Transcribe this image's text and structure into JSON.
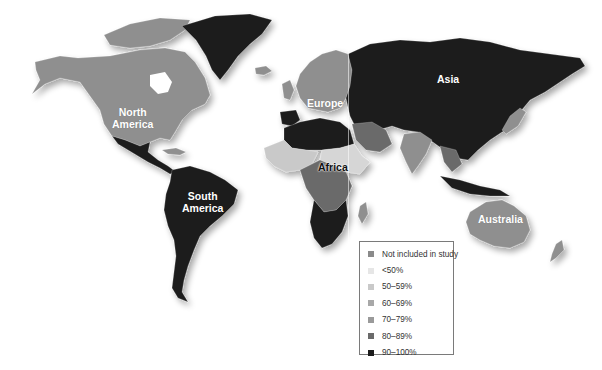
{
  "map": {
    "type": "choropleth world map",
    "regions": [
      {
        "id": "north-america",
        "label_line1": "North",
        "label_line2": "America",
        "category": "70-79%"
      },
      {
        "id": "south-america",
        "label_line1": "South",
        "label_line2": "America",
        "category": "90-100%"
      },
      {
        "id": "europe",
        "label_line1": "Europe",
        "category": "70-79%"
      },
      {
        "id": "africa",
        "label_line1": "Africa",
        "category": "mixed"
      },
      {
        "id": "asia",
        "label_line1": "Asia",
        "category": "90-100%"
      },
      {
        "id": "australia",
        "label_line1": "Australia",
        "category": "70-79%"
      }
    ]
  },
  "legend": {
    "items": [
      {
        "label": "Not included in study",
        "color": "#8a8a8a"
      },
      {
        "label": "<50%",
        "color": "#e6e6e6"
      },
      {
        "label": "50–59%",
        "color": "#c9c9c9"
      },
      {
        "label": "60–69%",
        "color": "#a8a8a8"
      },
      {
        "label": "70–79%",
        "color": "#9a9a9a"
      },
      {
        "label": "80–89%",
        "color": "#6a6a6a"
      },
      {
        "label": "90–100%",
        "color": "#1c1c1c"
      }
    ]
  },
  "colors": {
    "background": "#ffffff",
    "land_dark": "#1c1c1c",
    "land_mid": "#8f8f8f",
    "land_light": "#d6d6d6"
  }
}
